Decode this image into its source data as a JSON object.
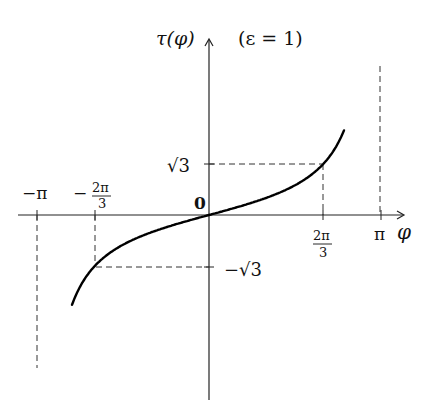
{
  "chart_data": {
    "type": "line",
    "title": "",
    "function_label": "τ(φ)",
    "parameter_annotation": "(ε = 1)",
    "xlabel": "φ",
    "ylabel": "τ(φ)",
    "origin_label": "0",
    "x_ticks": [
      {
        "value": -3.14159,
        "label": "−π"
      },
      {
        "value": -2.0944,
        "label_num": "2π",
        "label_den": "3",
        "sign": "−"
      },
      {
        "value": 2.0944,
        "label_num": "2π",
        "label_den": "3",
        "sign": ""
      },
      {
        "value": 3.14159,
        "label": "π"
      }
    ],
    "y_ticks": [
      {
        "value": 1.732,
        "label": "√3"
      },
      {
        "value": -1.732,
        "label": "−√3"
      }
    ],
    "xlim": [
      -3.5,
      3.6
    ],
    "ylim": [
      -6.3,
      6.0
    ],
    "grid": false,
    "legend": "none",
    "series": [
      {
        "name": "τ(φ)",
        "x": [
          -2.52,
          -2.4,
          -2.2,
          -2.0944,
          -2.0,
          -1.6,
          -1.2,
          -0.8,
          -0.4,
          0.0,
          0.4,
          0.8,
          1.2,
          1.6,
          2.0,
          2.0944,
          2.2,
          2.4,
          2.6,
          2.62
        ],
        "y": [
          -3.3,
          -2.65,
          -1.96,
          -1.732,
          -1.56,
          -1.03,
          -0.68,
          -0.42,
          -0.2,
          0.0,
          0.2,
          0.42,
          0.68,
          1.03,
          1.56,
          1.732,
          1.96,
          2.65,
          3.6,
          6.1
        ]
      }
    ],
    "reference_lines": [
      {
        "type": "vertical-dashed",
        "x": 3.14159,
        "label": "asymptote φ = π"
      },
      {
        "type": "vertical-dashed",
        "x": -3.14159,
        "label": "asymptote φ = −π"
      },
      {
        "type": "guide-dashed",
        "from": [
          0,
          1.732
        ],
        "to": [
          2.0944,
          1.732
        ]
      },
      {
        "type": "guide-dashed",
        "from": [
          2.0944,
          1.732
        ],
        "to": [
          2.0944,
          0
        ]
      },
      {
        "type": "guide-dashed",
        "from": [
          0,
          -1.732
        ],
        "to": [
          -2.0944,
          -1.732
        ]
      },
      {
        "type": "guide-dashed",
        "from": [
          -2.0944,
          -1.732
        ],
        "to": [
          -2.0944,
          0
        ]
      }
    ]
  },
  "labels": {
    "ylabel": "τ(φ)",
    "param": "(ε = 1)",
    "xlabel": "φ",
    "origin": "0",
    "neg_pi": "−π",
    "pi": "π",
    "two_pi": "2π",
    "three": "3",
    "minus": "−",
    "sqrt3": "√3",
    "neg_sqrt3": "−√3"
  }
}
